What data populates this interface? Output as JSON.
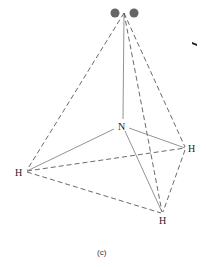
{
  "figure": {
    "caption": "(c)",
    "atoms": {
      "center": {
        "label": "N",
        "x": 122,
        "y": 125
      },
      "h_left": {
        "label": "H",
        "x": 25,
        "y": 172
      },
      "h_right": {
        "label": "H",
        "x": 187,
        "y": 148
      },
      "h_bottom": {
        "label": "H",
        "x": 163,
        "y": 214
      },
      "apex": {
        "label": "",
        "x": 124,
        "y": 13
      }
    },
    "lone_pair": {
      "label": "lone-pair-electrons",
      "dots": [
        {
          "x": 115,
          "y": 13
        },
        {
          "x": 134,
          "y": 13
        }
      ],
      "color": "#666666"
    },
    "bonds_solid": [
      "N-apex",
      "N-H_left",
      "N-H_right",
      "N-H_bottom"
    ],
    "edges_dashed": [
      "apex-H_left",
      "apex-H_right",
      "apex-H_bottom",
      "H_left-H_right",
      "H_left-H_bottom",
      "H_right-H_bottom"
    ]
  }
}
